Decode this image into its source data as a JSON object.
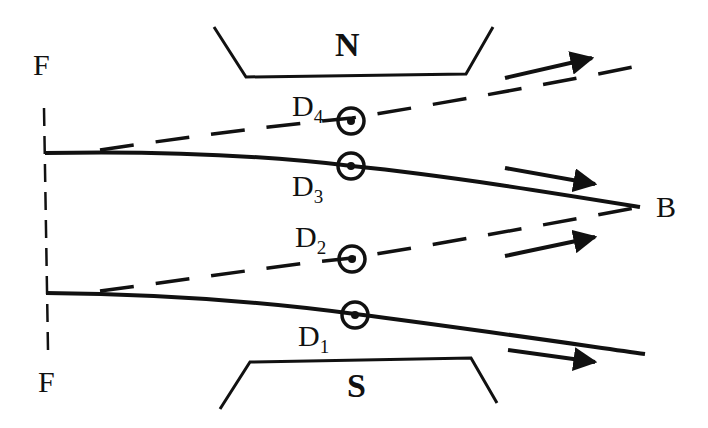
{
  "figure": {
    "type": "magnetic focusing diagram",
    "labels": {
      "F_top": "F",
      "F_bottom": "F",
      "B": "B",
      "N": "N",
      "S": "S"
    },
    "detectors": [
      {
        "id": "D1",
        "letter": "D",
        "sub": "1"
      },
      {
        "id": "D2",
        "letter": "D",
        "sub": "2"
      },
      {
        "id": "D3",
        "letter": "D",
        "sub": "3"
      },
      {
        "id": "D4",
        "letter": "D",
        "sub": "4"
      }
    ],
    "line_styles": {
      "solid": "real trajectory",
      "dashed": "deflected trajectory"
    },
    "colors": {
      "ink": "#111111",
      "background": "#ffffff"
    }
  }
}
